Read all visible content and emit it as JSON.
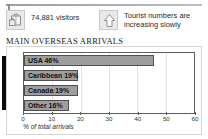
{
  "stats": [
    {
      "icon": "suitcase-icon",
      "value": "74,881 visitors"
    },
    {
      "icon": "up-arrow-icon",
      "value": "Tourist numbers are\nincreasing slowly"
    }
  ],
  "section": {
    "title": "MAIN OVERSEAS ARRIVALS"
  },
  "chart_data": {
    "type": "bar",
    "orientation": "horizontal",
    "title": "MAIN OVERSEAS ARRIVALS",
    "xlabel": "% of total arrivals",
    "ylabel": "",
    "categories": [
      "USA",
      "Caribbean",
      "Canada",
      "Other"
    ],
    "values": [
      46,
      19,
      19,
      16
    ],
    "bar_labels": [
      "USA 46%",
      "Caribbean 19%",
      "Canada 19%",
      "Other 16%"
    ],
    "xlim": [
      0,
      60
    ],
    "xticks": [
      0,
      10,
      20,
      30,
      40,
      50,
      60
    ],
    "xtick_labels": [
      "0",
      "10",
      "20",
      "30",
      "40",
      "50",
      "60"
    ],
    "grid": true,
    "legend": "none",
    "bar_color": "#9e9e9e",
    "bar_border_color": "#4f4f4f"
  },
  "colors": {
    "bar": "#9e9e9e",
    "bar_border": "#4f4f4f",
    "axis": "#5d5d5d",
    "grid": "#e2e2e2",
    "panel_border": "#d4d4d4",
    "icon_bg": "#e9e9e9",
    "text": "#2b2b2b"
  }
}
